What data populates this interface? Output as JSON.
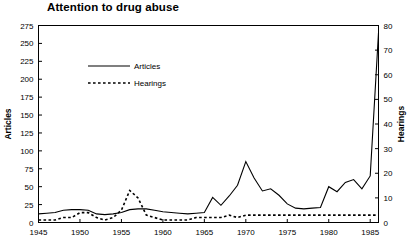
{
  "chart_data": {
    "type": "line",
    "title": "Attention to drug abuse",
    "xlabel": "",
    "grid": false,
    "legend_position": "upper-left-inside",
    "x": [
      1945,
      1946,
      1947,
      1948,
      1949,
      1950,
      1951,
      1952,
      1953,
      1954,
      1955,
      1956,
      1957,
      1958,
      1959,
      1960,
      1961,
      1962,
      1963,
      1964,
      1965,
      1966,
      1967,
      1968,
      1969,
      1970,
      1971,
      1972,
      1973,
      1974,
      1975,
      1976,
      1977,
      1978,
      1979,
      1980,
      1981,
      1982,
      1983,
      1984,
      1985,
      1986
    ],
    "xlim": [
      1945,
      1986
    ],
    "xticks": [
      1945,
      1950,
      1955,
      1960,
      1965,
      1970,
      1975,
      1980,
      1985
    ],
    "xticklabels": [
      "1945",
      "1950",
      "1955",
      "1960",
      "1965",
      "1970",
      "1975",
      "1980",
      "1985"
    ],
    "axes": [
      {
        "id": "left",
        "ylabel": "Articles",
        "ylim": [
          0,
          275
        ],
        "yticks": [
          0,
          25,
          50,
          75,
          100,
          125,
          150,
          175,
          200,
          225,
          250,
          275
        ],
        "yticklabels": [
          "0",
          "25",
          "50",
          "75",
          "100",
          "125",
          "150",
          "175",
          "200",
          "225",
          "250",
          "275"
        ]
      },
      {
        "id": "right",
        "ylabel": "Hearings",
        "ylim": [
          0,
          80
        ],
        "yticks": [
          0,
          10,
          20,
          30,
          40,
          50,
          60,
          70,
          80
        ],
        "yticklabels": [
          "0",
          "10",
          "20",
          "30",
          "40",
          "50",
          "60",
          "70",
          "80"
        ]
      }
    ],
    "series": [
      {
        "name": "Articles",
        "axis": "left",
        "style": "solid",
        "values": [
          12,
          13,
          14,
          17,
          18,
          18,
          17,
          12,
          11,
          12,
          14,
          18,
          19,
          19,
          17,
          15,
          14,
          13,
          12,
          13,
          14,
          35,
          24,
          37,
          52,
          85,
          62,
          44,
          47,
          38,
          26,
          20,
          19,
          20,
          21,
          50,
          43,
          56,
          60,
          47,
          65,
          265
        ]
      },
      {
        "name": "Hearings",
        "axis": "right",
        "style": "dashed",
        "values": [
          1,
          1,
          1,
          2,
          2,
          4,
          4,
          2,
          1,
          2,
          5,
          13,
          10,
          3,
          2,
          1,
          1,
          1,
          1,
          2,
          2,
          2,
          2,
          3,
          2,
          3,
          3,
          3,
          3,
          3,
          3,
          3,
          3,
          3,
          3,
          3,
          3,
          3,
          3,
          3,
          3,
          3
        ]
      }
    ]
  },
  "legend": {
    "entries": [
      {
        "label": "Articles",
        "style": "solid"
      },
      {
        "label": "Hearings",
        "style": "dashed"
      }
    ]
  }
}
